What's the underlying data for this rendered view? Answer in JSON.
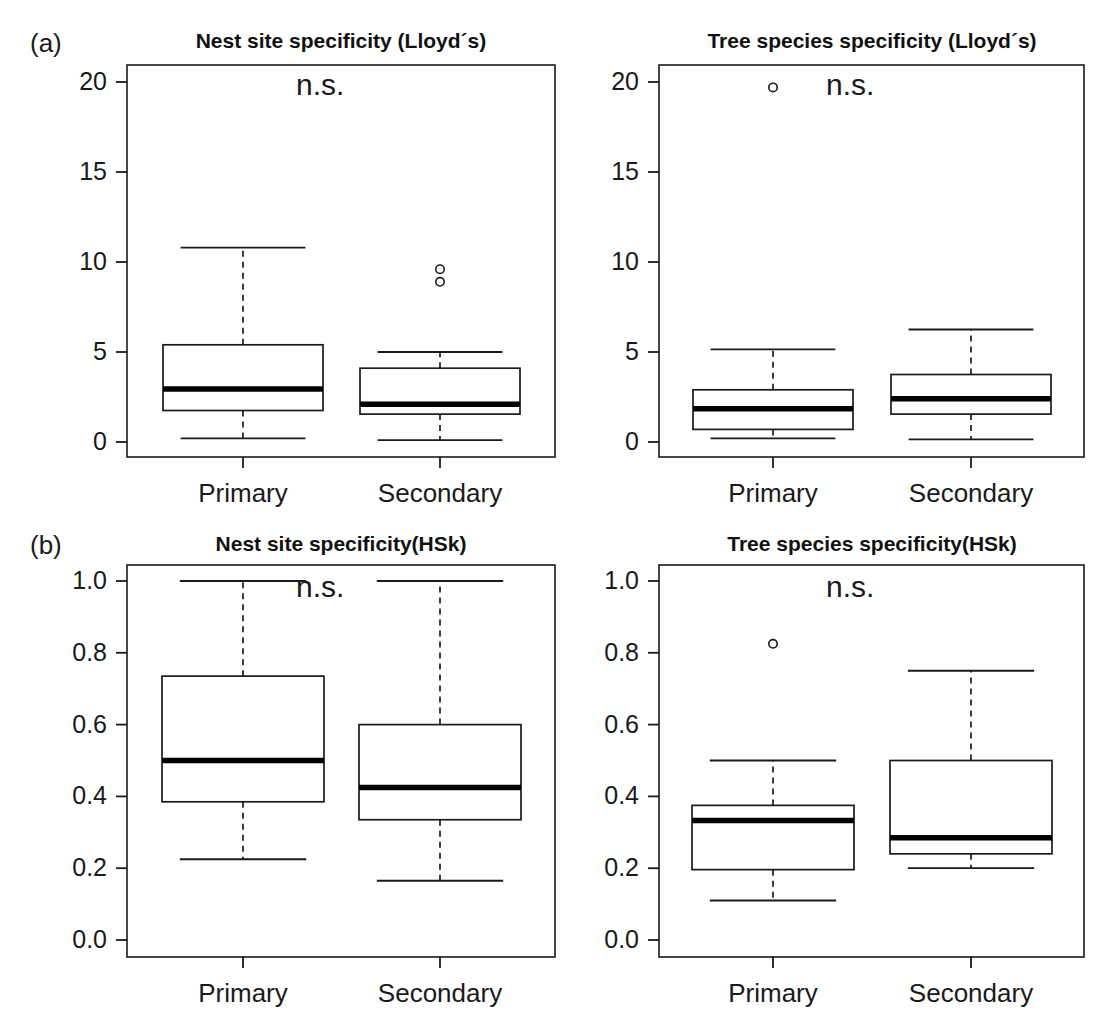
{
  "figure": {
    "panel_tags": [
      "(a)",
      "(b)"
    ],
    "significance_label": "n.s.",
    "group_labels": [
      "Primary",
      "Secondary"
    ]
  },
  "chart_data": [
    {
      "type": "box",
      "panel": "a-left",
      "title": "Nest site specificity (Lloyd´s)",
      "annotation": "n.s.",
      "xlabel": "",
      "ylabel": "",
      "ylim": [
        -0.6,
        20.9
      ],
      "yticks": [
        0,
        5,
        10,
        15,
        20
      ],
      "ytick_labels": [
        "0",
        "5",
        "10",
        "15",
        "20"
      ],
      "categories": [
        "Primary",
        "Secondary"
      ],
      "boxes": [
        {
          "category": "Primary",
          "whisker_low": 0.2,
          "q1": 1.75,
          "median": 2.95,
          "q3": 5.4,
          "whisker_high": 10.8,
          "outliers": []
        },
        {
          "category": "Secondary",
          "whisker_low": 0.1,
          "q1": 1.55,
          "median": 2.1,
          "q3": 4.1,
          "whisker_high": 5.0,
          "outliers": [
            9.6,
            8.9
          ]
        }
      ]
    },
    {
      "type": "box",
      "panel": "a-right",
      "title": "Tree species specificity (Lloyd´s)",
      "annotation": "n.s.",
      "xlabel": "",
      "ylabel": "",
      "ylim": [
        -0.6,
        20.9
      ],
      "yticks": [
        0,
        5,
        10,
        15,
        20
      ],
      "ytick_labels": [
        "0",
        "5",
        "10",
        "15",
        "20"
      ],
      "categories": [
        "Primary",
        "Secondary"
      ],
      "boxes": [
        {
          "category": "Primary",
          "whisker_low": 0.2,
          "q1": 0.7,
          "median": 1.85,
          "q3": 2.9,
          "whisker_high": 5.15,
          "outliers": [
            19.7
          ]
        },
        {
          "category": "Secondary",
          "whisker_low": 0.15,
          "q1": 1.55,
          "median": 2.4,
          "q3": 3.75,
          "whisker_high": 6.25,
          "outliers": []
        }
      ]
    },
    {
      "type": "box",
      "panel": "b-left",
      "title": "Nest site specificity(HSk)",
      "annotation": "n.s.",
      "xlabel": "",
      "ylabel": "",
      "ylim": [
        -0.03,
        1.045
      ],
      "yticks": [
        0.0,
        0.2,
        0.4,
        0.6,
        0.8,
        1.0
      ],
      "ytick_labels": [
        "0.0",
        "0.2",
        "0.4",
        "0.6",
        "0.8",
        "1.0"
      ],
      "categories": [
        "Primary",
        "Secondary"
      ],
      "boxes": [
        {
          "category": "Primary",
          "whisker_low": 0.225,
          "q1": 0.385,
          "median": 0.5,
          "q3": 0.735,
          "whisker_high": 1.0,
          "outliers": []
        },
        {
          "category": "Secondary",
          "whisker_low": 0.165,
          "q1": 0.335,
          "median": 0.425,
          "q3": 0.6,
          "whisker_high": 1.0,
          "outliers": []
        }
      ]
    },
    {
      "type": "box",
      "panel": "b-right",
      "title": "Tree species specificity(HSk)",
      "annotation": "n.s.",
      "xlabel": "",
      "ylabel": "",
      "ylim": [
        -0.03,
        1.045
      ],
      "yticks": [
        0.0,
        0.2,
        0.4,
        0.6,
        0.8,
        1.0
      ],
      "ytick_labels": [
        "0.0",
        "0.2",
        "0.4",
        "0.6",
        "0.8",
        "1.0"
      ],
      "categories": [
        "Primary",
        "Secondary"
      ],
      "boxes": [
        {
          "category": "Primary",
          "whisker_low": 0.11,
          "q1": 0.196,
          "median": 0.333,
          "q3": 0.375,
          "whisker_high": 0.5,
          "outliers": [
            0.825
          ]
        },
        {
          "category": "Secondary",
          "whisker_low": 0.2,
          "q1": 0.24,
          "median": 0.285,
          "q3": 0.5,
          "whisker_high": 0.75,
          "outliers": []
        }
      ]
    }
  ]
}
